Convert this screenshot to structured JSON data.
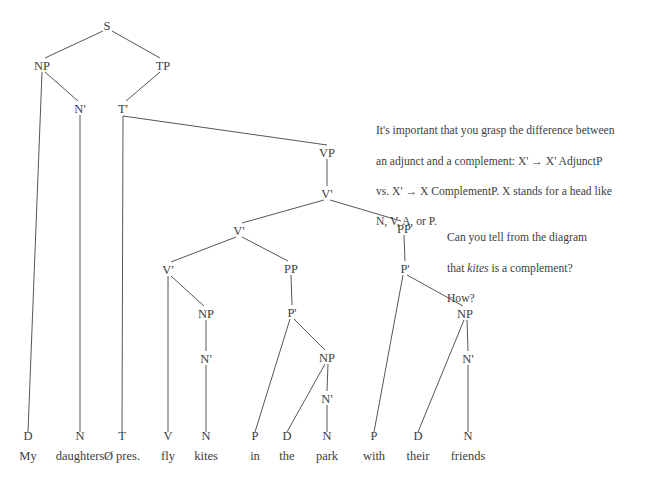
{
  "diagram": {
    "sentence": "My daughters Ø pres. fly kites in the park with their friends",
    "line_color": "#555555",
    "text_color": "#3d3d3d",
    "background": "#ffffff",
    "nodes": [
      {
        "id": "S",
        "label": "S",
        "x": 107,
        "y": 25
      },
      {
        "id": "NP1",
        "label": "NP",
        "x": 42,
        "y": 65
      },
      {
        "id": "TP",
        "label": "TP",
        "x": 163,
        "y": 65
      },
      {
        "id": "Nbar1",
        "label": "N'",
        "x": 80,
        "y": 108
      },
      {
        "id": "Tbar",
        "label": "T'",
        "x": 123,
        "y": 108
      },
      {
        "id": "VP",
        "label": "VP",
        "x": 327,
        "y": 152
      },
      {
        "id": "Vbar1",
        "label": "V'",
        "x": 327,
        "y": 193
      },
      {
        "id": "Vbar2",
        "label": "V'",
        "x": 239,
        "y": 230
      },
      {
        "id": "PP2",
        "label": "PP",
        "x": 404,
        "y": 228
      },
      {
        "id": "Vbar3",
        "label": "V'",
        "x": 168,
        "y": 269
      },
      {
        "id": "PP1",
        "label": "PP",
        "x": 291,
        "y": 268
      },
      {
        "id": "Pbar2",
        "label": "P'",
        "x": 405,
        "y": 268
      },
      {
        "id": "NP2",
        "label": "NP",
        "x": 206,
        "y": 313
      },
      {
        "id": "Pbar1",
        "label": "P'",
        "x": 292,
        "y": 312
      },
      {
        "id": "NP4",
        "label": "NP",
        "x": 465,
        "y": 313
      },
      {
        "id": "Nbar2",
        "label": "N'",
        "x": 206,
        "y": 358
      },
      {
        "id": "NP3",
        "label": "NP",
        "x": 327,
        "y": 357
      },
      {
        "id": "Nbar4",
        "label": "N'",
        "x": 468,
        "y": 358
      },
      {
        "id": "Nbar3",
        "label": "N'",
        "x": 327,
        "y": 398
      }
    ],
    "terminals": [
      {
        "id": "D1",
        "cat": "D",
        "word": "My",
        "x": 28,
        "cat_y": 440,
        "word_y": 460
      },
      {
        "id": "N1",
        "cat": "N",
        "word": "daughters",
        "x": 80,
        "cat_y": 440,
        "word_y": 460
      },
      {
        "id": "T1",
        "cat": "T",
        "word": "Ø pres.",
        "x": 122,
        "cat_y": 440,
        "word_y": 460
      },
      {
        "id": "V1",
        "cat": "V",
        "word": "fly",
        "x": 168,
        "cat_y": 440,
        "word_y": 460
      },
      {
        "id": "N2",
        "cat": "N",
        "word": "kites",
        "x": 206,
        "cat_y": 440,
        "word_y": 460
      },
      {
        "id": "P1",
        "cat": "P",
        "word": "in",
        "x": 255,
        "cat_y": 440,
        "word_y": 460
      },
      {
        "id": "D2",
        "cat": "D",
        "word": "the",
        "x": 287,
        "cat_y": 440,
        "word_y": 460
      },
      {
        "id": "N3",
        "cat": "N",
        "word": "park",
        "x": 327,
        "cat_y": 440,
        "word_y": 460
      },
      {
        "id": "P2",
        "cat": "P",
        "word": "with",
        "x": 374,
        "cat_y": 440,
        "word_y": 460
      },
      {
        "id": "D3",
        "cat": "D",
        "word": "their",
        "x": 418,
        "cat_y": 440,
        "word_y": 460
      },
      {
        "id": "N4",
        "cat": "N",
        "word": "friends",
        "x": 468,
        "cat_y": 440,
        "word_y": 460
      }
    ],
    "edges": [
      {
        "from": "S",
        "to": "NP1",
        "x1": 103,
        "y1": 31,
        "x2": 45,
        "y2": 58
      },
      {
        "from": "S",
        "to": "TP",
        "x1": 112,
        "y1": 31,
        "x2": 160,
        "y2": 58
      },
      {
        "from": "NP1",
        "to": "D1",
        "x1": 42,
        "y1": 72,
        "x2": 28,
        "y2": 432
      },
      {
        "from": "NP1",
        "to": "Nbar1",
        "x1": 45,
        "y1": 72,
        "x2": 78,
        "y2": 101
      },
      {
        "from": "Nbar1",
        "to": "N1",
        "x1": 80,
        "y1": 115,
        "x2": 80,
        "y2": 432
      },
      {
        "from": "TP",
        "to": "Tbar",
        "x1": 160,
        "y1": 72,
        "x2": 126,
        "y2": 101
      },
      {
        "from": "Tbar",
        "to": "T1",
        "x1": 123,
        "y1": 116,
        "x2": 122,
        "y2": 432
      },
      {
        "from": "Tbar",
        "to": "VP",
        "x1": 123,
        "y1": 116,
        "x2": 327,
        "y2": 145
      },
      {
        "from": "VP",
        "to": "Vbar1",
        "x1": 327,
        "y1": 159,
        "x2": 327,
        "y2": 186
      },
      {
        "from": "Vbar1",
        "to": "Vbar2",
        "x1": 324,
        "y1": 200,
        "x2": 242,
        "y2": 223
      },
      {
        "from": "Vbar1",
        "to": "PP2",
        "x1": 330,
        "y1": 200,
        "x2": 401,
        "y2": 221
      },
      {
        "from": "Vbar2",
        "to": "Vbar3",
        "x1": 236,
        "y1": 237,
        "x2": 171,
        "y2": 262
      },
      {
        "from": "Vbar2",
        "to": "PP1",
        "x1": 242,
        "y1": 237,
        "x2": 288,
        "y2": 261
      },
      {
        "from": "Vbar3",
        "to": "V1",
        "x1": 168,
        "y1": 276,
        "x2": 168,
        "y2": 432
      },
      {
        "from": "Vbar3",
        "to": "NP2",
        "x1": 171,
        "y1": 276,
        "x2": 204,
        "y2": 306
      },
      {
        "from": "NP2",
        "to": "Nbar2",
        "x1": 206,
        "y1": 320,
        "x2": 206,
        "y2": 351
      },
      {
        "from": "Nbar2",
        "to": "N2",
        "x1": 206,
        "y1": 365,
        "x2": 206,
        "y2": 432
      },
      {
        "from": "PP1",
        "to": "Pbar1",
        "x1": 291,
        "y1": 275,
        "x2": 292,
        "y2": 305
      },
      {
        "from": "Pbar1",
        "to": "P1",
        "x1": 290,
        "y1": 319,
        "x2": 255,
        "y2": 432
      },
      {
        "from": "Pbar1",
        "to": "NP3",
        "x1": 294,
        "y1": 319,
        "x2": 325,
        "y2": 350
      },
      {
        "from": "NP3",
        "to": "D2",
        "x1": 325,
        "y1": 364,
        "x2": 287,
        "y2": 432
      },
      {
        "from": "NP3",
        "to": "Nbar3",
        "x1": 328,
        "y1": 364,
        "x2": 327,
        "y2": 391
      },
      {
        "from": "Nbar3",
        "to": "N3",
        "x1": 327,
        "y1": 405,
        "x2": 327,
        "y2": 432
      },
      {
        "from": "PP2",
        "to": "Pbar2",
        "x1": 404,
        "y1": 235,
        "x2": 405,
        "y2": 261
      },
      {
        "from": "Pbar2",
        "to": "P2",
        "x1": 403,
        "y1": 275,
        "x2": 374,
        "y2": 432
      },
      {
        "from": "Pbar2",
        "to": "NP4",
        "x1": 407,
        "y1": 275,
        "x2": 463,
        "y2": 306
      },
      {
        "from": "NP4",
        "to": "D3",
        "x1": 464,
        "y1": 320,
        "x2": 418,
        "y2": 432
      },
      {
        "from": "NP4",
        "to": "Nbar4",
        "x1": 467,
        "y1": 320,
        "x2": 468,
        "y2": 351
      },
      {
        "from": "Nbar4",
        "to": "N4",
        "x1": 468,
        "y1": 365,
        "x2": 468,
        "y2": 432
      }
    ]
  },
  "notes": {
    "adjunct_note": {
      "line1": "It's important that you grasp the difference between",
      "line2": "an adjunct and a complement: X' → X' AdjunctP",
      "line3": "vs. X' → X ComplementP.  X stands for a head like",
      "line4": "N, V, A, or P."
    },
    "question_note": {
      "line1": "Can you tell from the diagram",
      "line2_pre": "that ",
      "line2_italic": "kites",
      "line2_post": " is a complement?",
      "line3": "How?"
    }
  }
}
